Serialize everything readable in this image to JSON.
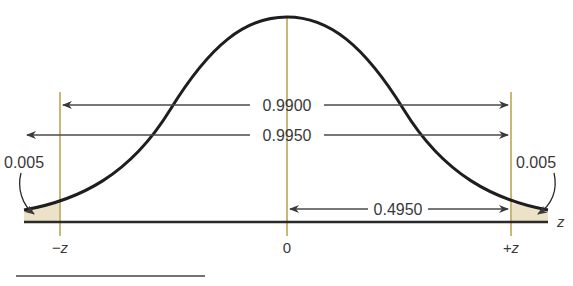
{
  "diagram": {
    "type": "normal-distribution",
    "labels": {
      "center_area": "0.9900",
      "wide_area": "0.9950",
      "half_area": "0.4950",
      "left_tail": "0.005",
      "right_tail": "0.005"
    },
    "axis": {
      "left_tick": "−z",
      "center_tick": "0",
      "right_tick": "+z",
      "axis_label": "z"
    },
    "colors": {
      "curve": "#1e1e1e",
      "verticals": "#c8b878",
      "tail_fill": "#ece2c8",
      "arrows": "#4a4a4a"
    }
  }
}
